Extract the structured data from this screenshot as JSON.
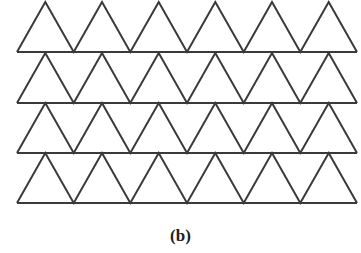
{
  "figure": {
    "caption": "(b)",
    "rows": 4,
    "triangles_per_row": 6,
    "pattern": "equilateral-triangle-tessellation",
    "stroke_color": "#3a3a3a",
    "fill_color": "#ffffff"
  }
}
